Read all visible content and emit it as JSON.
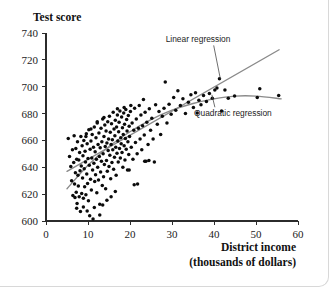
{
  "figure": {
    "title_y_axis": "Test score",
    "title_x_axis_line1": "District income",
    "title_x_axis_line2": "(thousands of dollars)"
  },
  "annotations": {
    "linear": "Linear regression",
    "quadratic": "Quadratic regression"
  },
  "colors": {
    "point": "#0b0b0b",
    "regression_line": "#8a8a8a",
    "axis": "#2b2b2b",
    "background": "#ffffff",
    "frame_border": "#d8d8d8"
  },
  "chart_data": {
    "type": "scatter",
    "title": "",
    "subtitle": "",
    "xlabel": "District income (thousands of dollars)",
    "ylabel": "Test score",
    "xlim": [
      0,
      60
    ],
    "ylim": [
      600,
      740
    ],
    "xticks": [
      0,
      10,
      20,
      30,
      40,
      50,
      60
    ],
    "yticks": [
      600,
      620,
      640,
      660,
      680,
      700,
      720,
      740
    ],
    "grid": false,
    "legend_position": "inline-annotation",
    "annotations": [
      {
        "text": "Linear regression",
        "text_x": 28.5,
        "text_y": 733,
        "leader_to_x": 41.5,
        "leader_to_y": 706
      },
      {
        "text": "Quadratic regression",
        "text_x": 44.5,
        "text_y": 678,
        "leader_to_x": 39.5,
        "leader_to_y": 694
      }
    ],
    "series": [
      {
        "name": "Linear regression",
        "type": "line",
        "style": "straight",
        "x": [
          5.0,
          55.5
        ],
        "y": [
          637.0,
          727.5
        ]
      },
      {
        "name": "Quadratic regression",
        "type": "line",
        "style": "curve",
        "x": [
          5.0,
          10,
          15,
          20,
          25,
          30,
          35,
          40,
          45,
          50,
          56.0
        ],
        "y": [
          624.0,
          641.5,
          655.5,
          666.5,
          675.5,
          682.5,
          687.5,
          691.0,
          693.0,
          693.0,
          691.0
        ]
      },
      {
        "name": "California school districts",
        "type": "scatter",
        "points": [
          [
            5.3,
            661.5
          ],
          [
            5.6,
            648.0
          ],
          [
            5.9,
            640.5
          ],
          [
            6.1,
            630.0
          ],
          [
            6.3,
            653.0
          ],
          [
            6.4,
            619.0
          ],
          [
            6.6,
            643.5
          ],
          [
            6.7,
            663.5
          ],
          [
            6.8,
            627.5
          ],
          [
            6.9,
            617.5
          ],
          [
            7.0,
            636.0
          ],
          [
            7.1,
            654.0
          ],
          [
            7.2,
            621.5
          ],
          [
            7.3,
            646.0
          ],
          [
            7.4,
            613.0
          ],
          [
            7.5,
            659.0
          ],
          [
            7.6,
            634.0
          ],
          [
            7.7,
            626.0
          ],
          [
            7.8,
            645.5
          ],
          [
            7.9,
            618.0
          ],
          [
            8.0,
            651.0
          ],
          [
            8.1,
            637.5
          ],
          [
            8.2,
            607.0
          ],
          [
            8.3,
            663.0
          ],
          [
            8.4,
            641.0
          ],
          [
            8.5,
            620.5
          ],
          [
            8.6,
            656.0
          ],
          [
            8.7,
            632.0
          ],
          [
            8.8,
            648.5
          ],
          [
            8.9,
            617.0
          ],
          [
            9.0,
            660.0
          ],
          [
            9.1,
            639.0
          ],
          [
            9.2,
            625.5
          ],
          [
            9.3,
            652.0
          ],
          [
            9.4,
            644.0
          ],
          [
            9.5,
            619.5
          ],
          [
            9.6,
            665.0
          ],
          [
            9.7,
            635.0
          ],
          [
            9.8,
            657.5
          ],
          [
            9.9,
            628.0
          ],
          [
            10.0,
            646.5
          ],
          [
            10.1,
            615.0
          ],
          [
            10.2,
            668.0
          ],
          [
            10.3,
            641.5
          ],
          [
            10.4,
            604.0
          ],
          [
            10.5,
            653.5
          ],
          [
            10.6,
            631.0
          ],
          [
            10.7,
            659.5
          ],
          [
            10.8,
            623.0
          ],
          [
            10.9,
            647.0
          ],
          [
            11.0,
            664.5
          ],
          [
            11.1,
            638.0
          ],
          [
            11.2,
            601.5
          ],
          [
            11.3,
            655.0
          ],
          [
            11.4,
            643.0
          ],
          [
            11.5,
            670.0
          ],
          [
            11.6,
            629.5
          ],
          [
            11.7,
            651.5
          ],
          [
            11.8,
            634.5
          ],
          [
            11.9,
            662.0
          ],
          [
            12.0,
            646.0
          ],
          [
            12.1,
            621.0
          ],
          [
            12.2,
            673.0
          ],
          [
            12.3,
            640.0
          ],
          [
            12.4,
            657.0
          ],
          [
            12.5,
            630.5
          ],
          [
            12.6,
            665.5
          ],
          [
            12.7,
            648.0
          ],
          [
            12.8,
            612.5
          ],
          [
            12.9,
            654.5
          ],
          [
            13.0,
            636.5
          ],
          [
            13.1,
            669.0
          ],
          [
            13.2,
            644.5
          ],
          [
            13.3,
            659.0
          ],
          [
            13.4,
            626.5
          ],
          [
            13.5,
            676.0
          ],
          [
            13.6,
            650.0
          ],
          [
            13.7,
            633.0
          ],
          [
            13.8,
            663.0
          ],
          [
            13.9,
            642.0
          ],
          [
            14.0,
            671.5
          ],
          [
            14.1,
            655.5
          ],
          [
            14.2,
            624.0
          ],
          [
            14.3,
            667.0
          ],
          [
            14.4,
            645.0
          ],
          [
            14.5,
            658.0
          ],
          [
            14.6,
            637.0
          ],
          [
            14.7,
            674.0
          ],
          [
            14.8,
            652.5
          ],
          [
            14.9,
            661.0
          ],
          [
            15.0,
            640.5
          ],
          [
            15.1,
            678.0
          ],
          [
            15.2,
            649.0
          ],
          [
            15.3,
            666.0
          ],
          [
            15.4,
            631.5
          ],
          [
            15.5,
            657.0
          ],
          [
            15.6,
            672.5
          ],
          [
            15.7,
            643.5
          ],
          [
            15.8,
            660.5
          ],
          [
            15.9,
            653.0
          ],
          [
            16.0,
            681.0
          ],
          [
            16.1,
            638.5
          ],
          [
            16.2,
            668.5
          ],
          [
            16.3,
            647.5
          ],
          [
            16.4,
            663.5
          ],
          [
            16.5,
            675.0
          ],
          [
            16.6,
            655.0
          ],
          [
            16.7,
            634.0
          ],
          [
            16.8,
            670.0
          ],
          [
            16.9,
            650.5
          ],
          [
            17.0,
            679.0
          ],
          [
            17.1,
            659.5
          ],
          [
            17.2,
            644.0
          ],
          [
            17.3,
            666.5
          ],
          [
            17.4,
            673.5
          ],
          [
            17.5,
            654.0
          ],
          [
            17.6,
            682.0
          ],
          [
            17.7,
            647.0
          ],
          [
            17.8,
            662.0
          ],
          [
            17.9,
            657.5
          ],
          [
            18.0,
            677.5
          ],
          [
            18.1,
            651.0
          ],
          [
            18.2,
            669.5
          ],
          [
            18.3,
            640.0
          ],
          [
            18.4,
            664.5
          ],
          [
            18.5,
            680.5
          ],
          [
            18.6,
            656.0
          ],
          [
            18.7,
            672.0
          ],
          [
            18.8,
            645.5
          ],
          [
            18.9,
            661.5
          ],
          [
            19.0,
            683.0
          ],
          [
            19.1,
            653.5
          ],
          [
            19.2,
            675.5
          ],
          [
            19.3,
            667.0
          ],
          [
            19.4,
            638.0
          ],
          [
            19.5,
            659.0
          ],
          [
            19.6,
            678.5
          ],
          [
            19.7,
            649.5
          ],
          [
            19.8,
            670.5
          ],
          [
            19.9,
            663.0
          ],
          [
            20.1,
            681.5
          ],
          [
            20.3,
            655.0
          ],
          [
            20.5,
            673.0
          ],
          [
            20.7,
            646.0
          ],
          [
            20.9,
            667.5
          ],
          [
            21.1,
            684.0
          ],
          [
            21.3,
            658.5
          ],
          [
            21.5,
            676.0
          ],
          [
            21.7,
            650.0
          ],
          [
            21.8,
            627.5
          ],
          [
            22.0,
            669.0
          ],
          [
            22.2,
            686.0
          ],
          [
            22.4,
            661.0
          ],
          [
            22.6,
            679.0
          ],
          [
            22.8,
            653.0
          ],
          [
            23.0,
            671.0
          ],
          [
            23.2,
            690.5
          ],
          [
            23.4,
            664.0
          ],
          [
            23.6,
            681.0
          ],
          [
            23.8,
            644.5
          ],
          [
            24.0,
            673.5
          ],
          [
            24.3,
            657.0
          ],
          [
            24.6,
            683.5
          ],
          [
            24.9,
            667.5
          ],
          [
            25.2,
            676.5
          ],
          [
            25.5,
            661.0
          ],
          [
            25.8,
            644.0
          ],
          [
            26.1,
            686.5
          ],
          [
            26.5,
            672.0
          ],
          [
            26.9,
            681.5
          ],
          [
            27.3,
            664.5
          ],
          [
            27.7,
            678.0
          ],
          [
            28.1,
            684.0
          ],
          [
            28.4,
            703.5
          ],
          [
            28.8,
            673.0
          ],
          [
            29.3,
            687.0
          ],
          [
            29.8,
            679.5
          ],
          [
            30.4,
            692.0
          ],
          [
            30.9,
            682.5
          ],
          [
            31.4,
            697.0
          ],
          [
            32.0,
            686.0
          ],
          [
            32.6,
            691.0
          ],
          [
            33.2,
            680.0
          ],
          [
            33.9,
            688.5
          ],
          [
            34.5,
            694.0
          ],
          [
            35.1,
            684.5
          ],
          [
            35.6,
            695.5
          ],
          [
            36.0,
            680.5
          ],
          [
            36.4,
            690.0
          ],
          [
            36.9,
            686.5
          ],
          [
            37.5,
            693.5
          ],
          [
            38.2,
            689.0
          ],
          [
            38.9,
            695.0
          ],
          [
            39.6,
            691.5
          ],
          [
            40.2,
            697.5
          ],
          [
            40.7,
            699.0
          ],
          [
            41.3,
            706.0
          ],
          [
            41.8,
            682.0
          ],
          [
            42.6,
            697.5
          ],
          [
            43.4,
            691.5
          ],
          [
            44.9,
            693.0
          ],
          [
            50.3,
            692.0
          ],
          [
            50.9,
            698.5
          ],
          [
            55.4,
            693.5
          ],
          [
            11.5,
            610.0
          ],
          [
            12.8,
            604.5
          ],
          [
            19.8,
            638.0
          ],
          [
            21.0,
            627.0
          ],
          [
            23.5,
            644.5
          ],
          [
            24.5,
            645.0
          ],
          [
            9.5,
            663.0
          ],
          [
            13.5,
            612.0
          ],
          [
            14.5,
            615.5
          ],
          [
            15.5,
            618.0
          ],
          [
            16.5,
            622.0
          ],
          [
            10.7,
            668.5
          ],
          [
            12.2,
            674.0
          ],
          [
            13.8,
            677.0
          ],
          [
            17.0,
            683.5
          ],
          [
            18.6,
            684.5
          ],
          [
            20.2,
            686.0
          ],
          [
            8.9,
            610.5
          ],
          [
            7.3,
            609.5
          ],
          [
            9.8,
            607.5
          ]
        ]
      }
    ]
  }
}
